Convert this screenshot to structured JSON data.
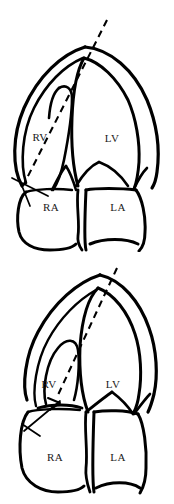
{
  "figure": {
    "kind": "anatomical-line-diagram",
    "background_color": "#ffffff",
    "line_color": "#000000",
    "panel_count": 2,
    "panels": [
      {
        "id": "top",
        "position": "upper",
        "chamber_labels": [
          {
            "key": "rv",
            "text": "RV",
            "x": 40,
            "y": 141
          },
          {
            "key": "lv",
            "text": "LV",
            "x": 112,
            "y": 142
          },
          {
            "key": "ra",
            "text": "RA",
            "x": 51,
            "y": 211
          },
          {
            "key": "la",
            "text": "LA",
            "x": 118,
            "y": 211
          }
        ],
        "axis": {
          "name": "dashed-long-axis",
          "style": "dashed",
          "x1": 107,
          "y1": 20,
          "x2": 23,
          "y2": 186
        },
        "marker": {
          "name": "apex-tick",
          "style": "solid",
          "x1": 12,
          "y1": 178,
          "x2": 48,
          "y2": 196
        }
      },
      {
        "id": "bottom",
        "position": "lower",
        "chamber_labels": [
          {
            "key": "rv",
            "text": "RV",
            "x": 49,
            "y": 388
          },
          {
            "key": "lv",
            "text": "LV",
            "x": 113,
            "y": 388
          },
          {
            "key": "ra",
            "text": "RA",
            "x": 55,
            "y": 461
          },
          {
            "key": "la",
            "text": "LA",
            "x": 118,
            "y": 461
          }
        ],
        "axis": {
          "name": "dashed-long-axis",
          "style": "dashed",
          "x1": 117,
          "y1": 268,
          "x2": 58,
          "y2": 395
        },
        "marker": {
          "name": "measurement-line",
          "style": "solid",
          "x1": 60,
          "y1": 401,
          "x2": 24,
          "y2": 431
        }
      }
    ]
  }
}
